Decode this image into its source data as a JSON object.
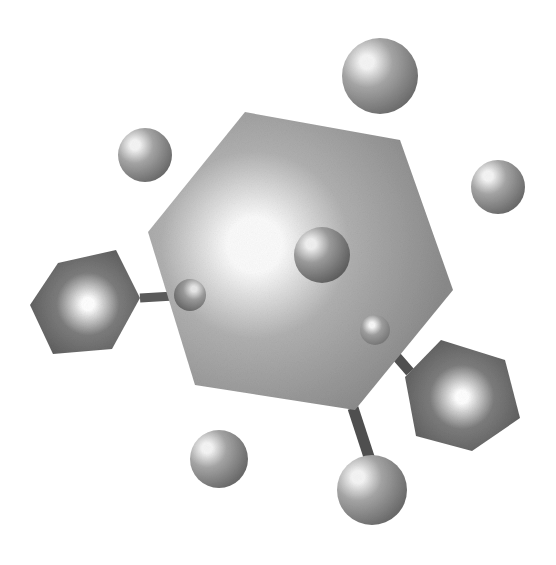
{
  "canvas": {
    "width": 556,
    "height": 565,
    "background_color": "#ffffff",
    "title": "Molecular structure illustration",
    "style": "grayscale airbrushed ball-and-stick diagram"
  },
  "palette": {
    "background": "#ffffff",
    "main_ring_light": "#fdfdfd",
    "main_ring_mid": "#b4b4b4",
    "main_ring_dark": "#8e8e8e",
    "side_ring_light": "#f7f7f7",
    "side_ring_mid": "#8a8a8a",
    "side_ring_dark": "#4a4a4a",
    "sphere_light": "#f2f2f2",
    "sphere_mid": "#a8a8a8",
    "sphere_dark": "#6e6e6e",
    "bond": "#555555",
    "outline": "#7a7a7a"
  },
  "shapes": {
    "rings": [
      {
        "id": "main-ring",
        "name": "central-hexagon-ring",
        "label": "Central aromatic ring",
        "points": "245,112 400,140 453,290 355,410 195,385 148,232",
        "highlight": {
          "cx": 255,
          "cy": 245,
          "r": 195
        },
        "light": "#fbfbfb",
        "mid": "#b0b0b0",
        "dark": "#8a8a8a",
        "stops": [
          0,
          14,
          48,
          100
        ]
      },
      {
        "id": "left-ring",
        "name": "left-hexagon-ring",
        "label": "Left substituent ring",
        "points": "58,263 116,250 140,298 112,349 53,354 30,305",
        "highlight": {
          "cx": 88,
          "cy": 304,
          "r": 78
        },
        "light": "#ffffff",
        "mid": "#7d7d7d",
        "dark": "#4d4d4d",
        "stops": [
          0,
          8,
          40,
          100
        ]
      },
      {
        "id": "right-ring",
        "name": "right-hexagon-ring",
        "label": "Right substituent ring",
        "points": "441,340 505,360 520,418 472,451 416,436 405,377",
        "highlight": {
          "cx": 462,
          "cy": 397,
          "r": 80
        },
        "light": "#ffffff",
        "mid": "#7d7d7d",
        "dark": "#4d4d4d",
        "stops": [
          0,
          8,
          40,
          100
        ]
      }
    ],
    "spheres": [
      {
        "id": "sphere-top",
        "name": "atom-sphere-top",
        "cx": 380,
        "cy": 76,
        "r": 38,
        "hx": 367,
        "hy": 62,
        "light": "#f4f4f4",
        "mid": "#a5a5a5",
        "dark": "#6a6a6a"
      },
      {
        "id": "sphere-upper-left",
        "name": "atom-sphere-upper-left",
        "cx": 145,
        "cy": 155,
        "r": 27,
        "hx": 135,
        "hy": 145,
        "light": "#f4f4f4",
        "mid": "#a5a5a5",
        "dark": "#6a6a6a"
      },
      {
        "id": "sphere-right",
        "name": "atom-sphere-right",
        "cx": 498,
        "cy": 187,
        "r": 27,
        "hx": 488,
        "hy": 176,
        "light": "#f4f4f4",
        "mid": "#a5a5a5",
        "dark": "#6a6a6a"
      },
      {
        "id": "sphere-center",
        "name": "atom-sphere-center",
        "cx": 322,
        "cy": 255,
        "r": 28,
        "hx": 311,
        "hy": 244,
        "light": "#efefef",
        "mid": "#9b9b9b",
        "dark": "#5f5f5f"
      },
      {
        "id": "sphere-small-left",
        "name": "atom-sphere-small-left",
        "cx": 190,
        "cy": 295,
        "r": 16,
        "hx": 194,
        "hy": 289,
        "light": "#e6e6e6",
        "mid": "#9a9a9a",
        "dark": "#636363"
      },
      {
        "id": "sphere-small-right",
        "name": "atom-sphere-small-right",
        "cx": 375,
        "cy": 330,
        "r": 15,
        "hx": 372,
        "hy": 325,
        "light": "#f6f6f6",
        "mid": "#9d9d9d",
        "dark": "#707070"
      },
      {
        "id": "sphere-bottom-left",
        "name": "atom-sphere-bottom-left",
        "cx": 219,
        "cy": 459,
        "r": 29,
        "hx": 207,
        "hy": 448,
        "light": "#f4f4f4",
        "mid": "#a5a5a5",
        "dark": "#6a6a6a"
      },
      {
        "id": "sphere-bottom-right",
        "name": "atom-sphere-bottom-right",
        "cx": 372,
        "cy": 490,
        "r": 35,
        "hx": 358,
        "hy": 477,
        "light": "#f4f4f4",
        "mid": "#a5a5a5",
        "dark": "#6a6a6a"
      }
    ],
    "bonds": [
      {
        "id": "bond-left",
        "name": "bond-left-ring-to-small-sphere",
        "x1": 140,
        "y1": 298,
        "x2": 191,
        "y2": 295,
        "width": 9,
        "color": "#5a5a5a"
      },
      {
        "id": "bond-right",
        "name": "bond-small-sphere-to-right-ring",
        "x1": 377,
        "y1": 334,
        "x2": 410,
        "y2": 372,
        "width": 10,
        "color": "#4f4f4f"
      },
      {
        "id": "bond-bottom-right",
        "name": "bond-main-ring-to-bottom-sphere",
        "x1": 353,
        "y1": 408,
        "x2": 371,
        "y2": 463,
        "width": 11,
        "color": "#4f4f4f"
      }
    ]
  },
  "semantics": {
    "ring_count": 3,
    "sphere_count": 8,
    "bond_count": 3,
    "description": "Airbrushed grayscale molecule: one large central hexagonal ring with two smaller darker hexagonal rings attached by bonds, surrounded by eight spherical atoms."
  }
}
